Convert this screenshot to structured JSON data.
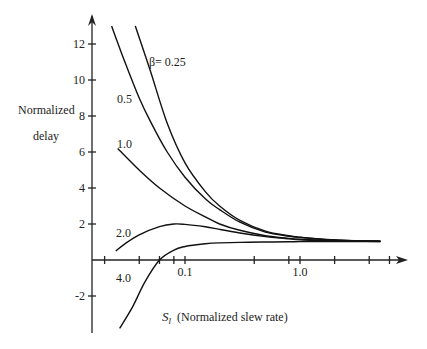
{
  "chart_data": {
    "type": "line",
    "title": "",
    "ylabel_line1": "Normalized",
    "ylabel_line2": "delay",
    "xlabel_symbol": "S",
    "xlabel_subscript": "l",
    "xlabel_text": "(Normalized slew rate)",
    "xscale": "log",
    "ylim": [
      -3.9,
      13.5
    ],
    "yticks": [
      -2,
      2,
      4,
      6,
      8,
      10,
      12
    ],
    "ytick_labels": [
      "-2",
      "2",
      "4",
      "6",
      "8",
      "10",
      "12"
    ],
    "xtick_values": [
      0.02,
      0.04,
      0.06,
      0.08,
      0.1,
      0.4,
      0.8,
      1.0,
      2.0,
      4.0,
      6.0
    ],
    "xtick_labels": [
      {
        "value": 0.1,
        "label": "0.1"
      },
      {
        "value": 1.0,
        "label": "1.0"
      }
    ],
    "grid": false,
    "legend": "inline curve labels",
    "series": [
      {
        "name": "β= 0.25",
        "label": "β= 0.25",
        "x": [
          0.037,
          0.05,
          0.07,
          0.1,
          0.15,
          0.2,
          0.3,
          0.5,
          0.8,
          1.0,
          1.5,
          2.0,
          3.0,
          5.0
        ],
        "y": [
          13.0,
          10.5,
          7.6,
          5.4,
          3.8,
          3.0,
          2.2,
          1.6,
          1.35,
          1.27,
          1.17,
          1.12,
          1.07,
          1.05
        ]
      },
      {
        "name": "0.5",
        "label": "0.5",
        "x": [
          0.023,
          0.03,
          0.04,
          0.05,
          0.07,
          0.1,
          0.15,
          0.2,
          0.3,
          0.5,
          0.8,
          1.0,
          1.5,
          2.0,
          3.0,
          5.0
        ],
        "y": [
          13.0,
          11.0,
          9.0,
          7.7,
          6.0,
          4.6,
          3.4,
          2.8,
          2.1,
          1.55,
          1.32,
          1.25,
          1.15,
          1.1,
          1.07,
          1.05
        ]
      },
      {
        "name": "1.0",
        "label": "1.0",
        "x": [
          0.026,
          0.04,
          0.06,
          0.1,
          0.15,
          0.2,
          0.3,
          0.5,
          0.8,
          1.0,
          1.5,
          2.0,
          3.0,
          5.0
        ],
        "y": [
          6.2,
          5.0,
          4.0,
          3.0,
          2.4,
          2.0,
          1.65,
          1.35,
          1.2,
          1.15,
          1.1,
          1.07,
          1.05,
          1.04
        ]
      },
      {
        "name": "2.0",
        "label": "2.0",
        "x": [
          0.025,
          0.03,
          0.04,
          0.06,
          0.08,
          0.1,
          0.15,
          0.2,
          0.3,
          0.5,
          0.8,
          1.0,
          1.5,
          2.0,
          3.0,
          5.0
        ],
        "y": [
          0.5,
          0.9,
          1.4,
          1.85,
          2.0,
          1.98,
          1.85,
          1.7,
          1.5,
          1.3,
          1.17,
          1.12,
          1.08,
          1.05,
          1.04,
          1.03
        ]
      },
      {
        "name": "4.0",
        "label": "4.0",
        "x": [
          0.027,
          0.035,
          0.045,
          0.06,
          0.08,
          0.1,
          0.15,
          0.2,
          0.3,
          0.5,
          0.8,
          1.0,
          2.0,
          5.0
        ],
        "y": [
          -3.8,
          -2.6,
          -1.2,
          0.0,
          0.55,
          0.75,
          0.9,
          0.95,
          0.98,
          1.0,
          1.01,
          1.02,
          1.02,
          1.02
        ]
      }
    ]
  }
}
